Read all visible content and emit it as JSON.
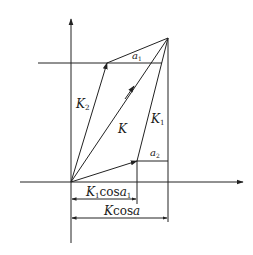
{
  "diagram": {
    "type": "vector-phasor-diagram",
    "stroke_color": "#222222",
    "background": "#ffffff",
    "labels": {
      "K2": {
        "main": "K",
        "sub": "2"
      },
      "K": {
        "main": "K"
      },
      "K1": {
        "main": "K",
        "sub": "1"
      },
      "a1": {
        "main": "a",
        "sub": "1"
      },
      "a2": {
        "main": "a",
        "sub": "2"
      },
      "K1cos": {
        "pre": "K",
        "pre_sub": "1",
        "mid": "cos",
        "post": "a",
        "post_sub": "1"
      },
      "Kcos": {
        "pre": "K",
        "mid": "cos",
        "post": "a"
      }
    },
    "vectors": [
      {
        "name": "K2",
        "from": [
          71,
          182
        ],
        "to": [
          107,
          63
        ]
      },
      {
        "name": "K",
        "from": [
          71,
          182
        ],
        "to": [
          168,
          38
        ]
      },
      {
        "name": "K1",
        "from": [
          137,
          161
        ],
        "to": [
          168,
          38
        ]
      },
      {
        "name": "K1-base",
        "from": [
          71,
          182
        ],
        "to": [
          137,
          161
        ]
      }
    ]
  }
}
